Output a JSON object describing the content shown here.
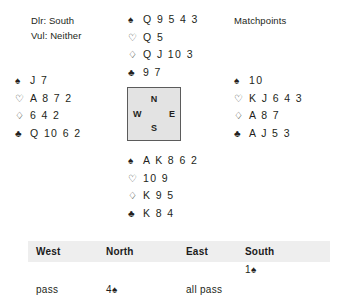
{
  "deal_info": {
    "dealer_label": "Dlr: South",
    "vulnerability_label": "Vul: Neither",
    "scoring_label": "Matchpoints"
  },
  "suit_symbols": {
    "spade": "♠",
    "heart": "♡",
    "diamond": "♢",
    "club": "♣"
  },
  "hands": {
    "north": {
      "position": "North",
      "spades": "Q 9 5 4 3",
      "hearts": "Q 5",
      "diamonds": "Q J 10 3",
      "clubs": "9 7"
    },
    "west": {
      "position": "West",
      "spades": "J 7",
      "hearts": "A 8 7 2",
      "diamonds": "6 4 2",
      "clubs": "Q 10 6 2"
    },
    "east": {
      "position": "East",
      "spades": "10",
      "hearts": "K J 6 4 3",
      "diamonds": "A 8 7",
      "clubs": "A J 5 3"
    },
    "south": {
      "position": "South",
      "spades": "A K 8 6 2",
      "hearts": "10 9",
      "diamonds": "K 9 5",
      "clubs": "K 8 4"
    }
  },
  "compass": {
    "north": "N",
    "east": "E",
    "south": "S",
    "west": "W"
  },
  "auction": {
    "headers": [
      "West",
      "North",
      "East",
      "South"
    ],
    "rows": [
      {
        "west": "",
        "north": "",
        "east": "",
        "south_level": "1",
        "south_suit": "♠"
      },
      {
        "west": "pass",
        "north_level": "4",
        "north_suit": "♠",
        "east": "all pass",
        "south": ""
      }
    ]
  },
  "colors": {
    "text": "#231f20",
    "header_band": "#eeeeee",
    "compass_fill": "#e3e3e3",
    "compass_border": "#5b5b5b"
  }
}
